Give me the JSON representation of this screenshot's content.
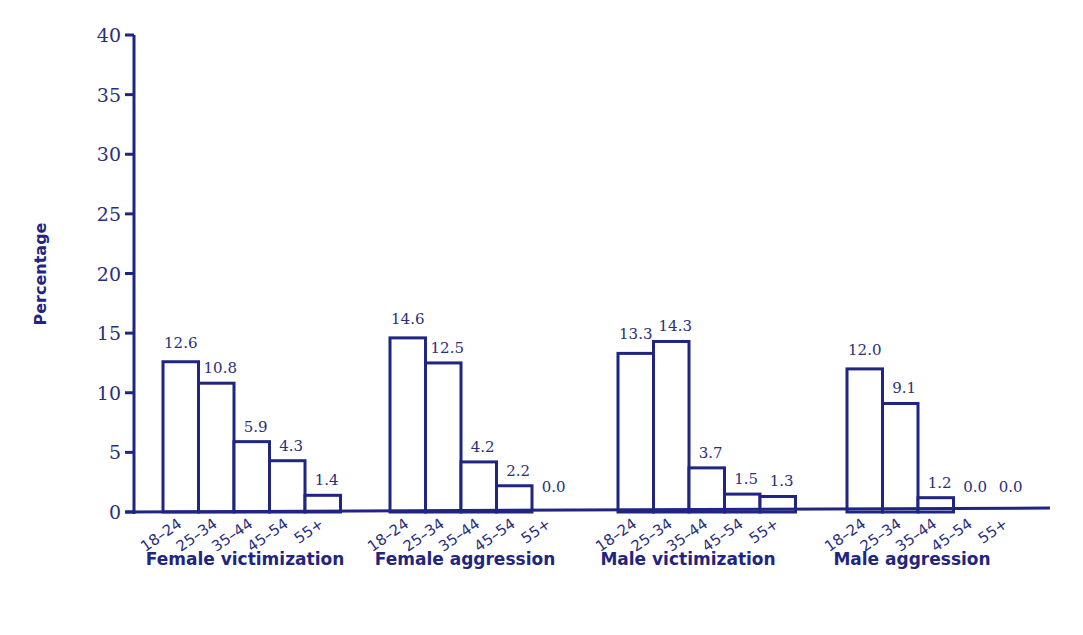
{
  "chart_data": {
    "type": "bar",
    "title": "",
    "xlabel": "",
    "ylabel": "Percentage",
    "ylim": [
      0,
      40
    ],
    "yticks": [
      0,
      5,
      10,
      15,
      20,
      25,
      30,
      35,
      40
    ],
    "grid": false,
    "legend": null,
    "categories": [
      "18–24",
      "25–34",
      "35–44",
      "45–54",
      "55+"
    ],
    "groups": [
      {
        "name": "Female victimization",
        "values": [
          12.6,
          10.8,
          5.9,
          4.3,
          1.4
        ]
      },
      {
        "name": "Female aggression",
        "values": [
          14.6,
          12.5,
          4.2,
          2.2,
          0.0
        ]
      },
      {
        "name": "Male victimization",
        "values": [
          13.3,
          14.3,
          3.7,
          1.5,
          1.3
        ]
      },
      {
        "name": "Male aggression",
        "values": [
          12.0,
          9.1,
          1.2,
          0.0,
          0.0
        ]
      }
    ],
    "colors": {
      "axis": "#1f2580",
      "bar_stroke": "#1f2580",
      "bar_fill": "#ffffff",
      "text": "#2a2f7a"
    }
  }
}
